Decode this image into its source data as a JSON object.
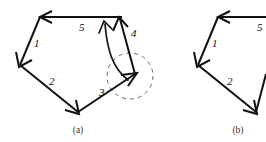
{
  "figure": {
    "width": 266,
    "height": 142,
    "background": "#ffffff",
    "stroke_color": "#111111",
    "dashed_color": "#6a6a6a"
  },
  "panels": [
    {
      "id": "a",
      "caption": "(a)",
      "caption_x": 78,
      "caption_y": 133,
      "edge_labels": [
        {
          "text": "1",
          "x": 34,
          "y": 47
        },
        {
          "text": "2",
          "x": 49,
          "y": 85
        },
        {
          "text": "3",
          "x": 99,
          "y": 96
        },
        {
          "text": "4",
          "x": 131,
          "y": 37
        },
        {
          "text": "5",
          "x": 79,
          "y": 31
        }
      ],
      "has_dashed_circle": true,
      "has_curved_arrow": true,
      "dashed_circle": {
        "cx": 130,
        "cy": 76,
        "r": 23
      }
    },
    {
      "id": "b",
      "caption": "(b)",
      "caption_x": 238,
      "caption_y": 133,
      "edge_labels": [
        {
          "text": "1",
          "x": 212,
          "y": 47
        },
        {
          "text": "2",
          "x": 227,
          "y": 85
        },
        {
          "text": "5",
          "x": 257,
          "y": 31
        }
      ],
      "has_dashed_circle": false,
      "has_curved_arrow": false
    }
  ]
}
